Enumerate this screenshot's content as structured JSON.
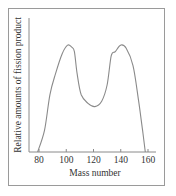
{
  "chart_data": {
    "type": "line",
    "title": "",
    "xlabel": "Mass number",
    "ylabel": "Relative amounts of fission product",
    "xlim": [
      72,
      162
    ],
    "ylim": [
      0,
      130
    ],
    "x_ticks": [
      80,
      100,
      120,
      140,
      160
    ],
    "y_ticks": [],
    "grid": false,
    "legend": null,
    "series": [
      {
        "name": "Fission product yield",
        "x": [
          79,
          84,
          88,
          92,
          97,
          101,
          104,
          106,
          108,
          111,
          116,
          121,
          126,
          130,
          133,
          136,
          140,
          144,
          149,
          153,
          156,
          158
        ],
        "y": [
          0,
          20,
          53,
          72,
          91,
          99,
          97,
          93,
          72,
          53,
          45,
          42,
          47,
          62,
          89,
          93,
          99,
          96,
          80,
          48,
          20,
          0
        ]
      }
    ]
  },
  "colors": {
    "line": "#8a8a8a",
    "axis": "#8a8a8a",
    "frame": "#9a9a9a",
    "text": "#333333"
  }
}
